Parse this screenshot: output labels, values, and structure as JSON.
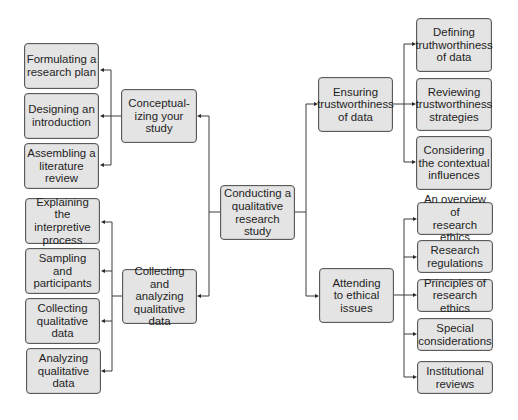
{
  "diagram": {
    "root": {
      "label": "Conducting a\nqualitative\nresearch\nstudy"
    },
    "branches": {
      "conceptualizing": {
        "label": "Conceptual-\nizing your\nstudy",
        "children": [
          {
            "label": "Formulating a\nresearch plan"
          },
          {
            "label": "Designing an\nintroduction"
          },
          {
            "label": "Assembling a\nliterature\nreview"
          }
        ]
      },
      "collecting": {
        "label": "Collecting and\nanalyzing\nqualitative\ndata",
        "children": [
          {
            "label": "Explaining\nthe interpretive\nprocess"
          },
          {
            "label": "Sampling\nand\nparticipants"
          },
          {
            "label": "Collecting\nqualitative\ndata"
          },
          {
            "label": "Analyzing\nqualitative\ndata"
          }
        ]
      },
      "trustworthiness": {
        "label": "Ensuring\ntrustworthiness\nof data",
        "children": [
          {
            "label": "Defining\ntruthworthiness\nof data"
          },
          {
            "label": "Reviewing\ntrustworthiness\nstrategies"
          },
          {
            "label": "Considering\nthe contextual\ninfluences"
          }
        ]
      },
      "ethics": {
        "label": "Attending\nto ethical\nissues",
        "children": [
          {
            "label": "An overview of\nresearch ethics"
          },
          {
            "label": "Research\nregulations"
          },
          {
            "label": "Principles of\nresearch ethics"
          },
          {
            "label": "Special\nconsiderations"
          },
          {
            "label": "Institutional\nreviews"
          }
        ]
      }
    },
    "colors": {
      "box_fill": "#e4e4e4",
      "box_border": "#5a5a5a",
      "line": "#3c3c3c",
      "text": "#1e1e1e"
    }
  }
}
